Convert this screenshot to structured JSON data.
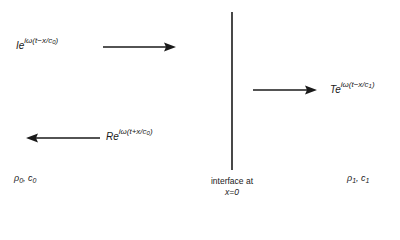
{
  "diagram": {
    "interface": {
      "label_line1": "interface at",
      "label_line2": "x=0",
      "position_x": 232
    },
    "waves": {
      "incident": {
        "amplitude": "I",
        "base": "e",
        "exponent_prefix": "iω(t−x/c",
        "exponent_sub": "0",
        "exponent_suffix": ")",
        "direction": "right"
      },
      "transmitted": {
        "amplitude": "T",
        "base": "e",
        "exponent_prefix": "iω(t−x/c",
        "exponent_sub": "1",
        "exponent_suffix": ")",
        "direction": "right"
      },
      "reflected": {
        "amplitude": "R",
        "base": "e",
        "exponent_prefix": "iω(t+x/c",
        "exponent_sub": "0",
        "exponent_suffix": ")",
        "direction": "left"
      }
    },
    "media": {
      "left": {
        "rho": "ρ",
        "rho_sub": "0",
        "c": "c",
        "c_sub": "0",
        "sep": ", "
      },
      "right": {
        "rho": "ρ",
        "rho_sub": "1",
        "c": "c",
        "c_sub": "1",
        "sep": ", "
      }
    },
    "colors": {
      "ink": "#1a1a1a",
      "background": "#ffffff"
    }
  }
}
